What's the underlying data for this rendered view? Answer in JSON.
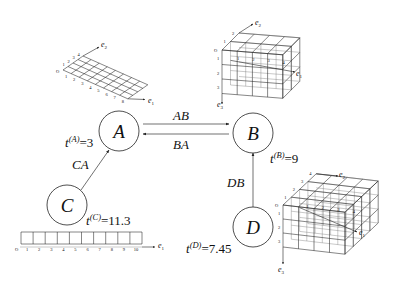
{
  "diagram": {
    "type": "state-transition graph with tensor/grid annotations",
    "nodes": [
      {
        "id": "A",
        "label": "A",
        "time_prefix": "t",
        "time_sup": "(A)",
        "time_value": "=3",
        "grid": "2D grid 8×4 (axes e1, e2)"
      },
      {
        "id": "B",
        "label": "B",
        "time_prefix": "t",
        "time_sup": "(B)",
        "time_value": "=9",
        "grid": "3D grid 4×2×3 (axes e1, e2, e3)"
      },
      {
        "id": "C",
        "label": "C",
        "time_prefix": "t",
        "time_sup": "(C)",
        "time_value": "=11.3",
        "grid": "1D grid 10 cells (axis e1)"
      },
      {
        "id": "D",
        "label": "D",
        "time_prefix": "t",
        "time_sup": "(D)",
        "time_value": "=7.45",
        "grid": "3D grid 4×4×3 (axes e1, e2, e3)"
      }
    ],
    "edges": [
      {
        "id": "AB",
        "label": "AB",
        "from": "A",
        "to": "B"
      },
      {
        "id": "BA",
        "label": "BA",
        "from": "B",
        "to": "A"
      },
      {
        "id": "CA",
        "label": "CA",
        "from": "C",
        "to": "A"
      },
      {
        "id": "DB",
        "label": "DB",
        "from": "D",
        "to": "B"
      }
    ]
  },
  "grids": {
    "A": {
      "origin": "O",
      "axis1": {
        "base": "e",
        "sub": "1"
      },
      "axis2": {
        "base": "e",
        "sub": "2"
      },
      "ticks1": [
        "1",
        "2",
        "3",
        "4",
        "5",
        "6",
        "7",
        "8"
      ],
      "ticks2": [
        "1",
        "2",
        "3",
        "4"
      ]
    },
    "B": {
      "origin": "O",
      "axis1": {
        "base": "e",
        "sub": "1"
      },
      "axis2": {
        "base": "e",
        "sub": "2"
      },
      "axis3": {
        "base": "e",
        "sub": "3"
      },
      "ticks1": [
        "1",
        "2",
        "3",
        "4"
      ],
      "ticks2": [
        "1",
        "2"
      ],
      "ticks3": [
        "1",
        "2",
        "3"
      ]
    },
    "C": {
      "origin": "O",
      "axis1": {
        "base": "e",
        "sub": "1"
      },
      "ticks1": [
        "1",
        "2",
        "3",
        "4",
        "5",
        "6",
        "7",
        "8",
        "9",
        "10"
      ]
    },
    "D": {
      "origin": "O",
      "axis1": {
        "base": "e",
        "sub": "1"
      },
      "axis2": {
        "base": "e",
        "sub": "2"
      },
      "axis3": {
        "base": "e",
        "sub": "3"
      },
      "ticks1": [
        "1",
        "2",
        "3",
        "4"
      ],
      "ticks2": [
        "1",
        "2",
        "3",
        "4"
      ],
      "ticks3": [
        "1",
        "2",
        "3"
      ]
    }
  },
  "colors": {
    "line": "#222222",
    "text": "#111111",
    "background": "#ffffff"
  }
}
